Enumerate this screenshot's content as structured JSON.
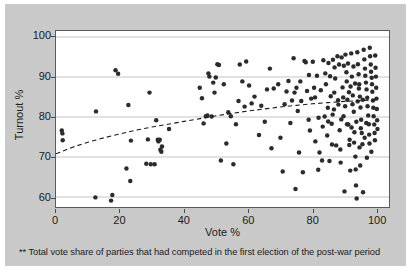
{
  "figure": {
    "footnote": "** Total vote share of parties that had competed in the first election of the post-war period",
    "background_color": "#c9c9c9",
    "plot_background_color": "#ffffff",
    "point_color": "#2b2b2b",
    "gridline_color": "#c4c4c4",
    "trendline_color": "#1b1b1b"
  },
  "chart_data": {
    "type": "scatter",
    "title": "",
    "subtitle": "",
    "xlabel": "Vote %",
    "ylabel": "Turnout %",
    "xlim": [
      0,
      104
    ],
    "ylim": [
      57.5,
      101.5
    ],
    "xticks": [
      0,
      20,
      40,
      60,
      80,
      100
    ],
    "xticklabels": [
      "0",
      "20",
      "40",
      "60",
      "80",
      "100"
    ],
    "yticks": [
      60,
      70,
      80,
      90,
      100
    ],
    "yticklabels": [
      "60",
      "70",
      "80",
      "90",
      "100"
    ],
    "grid": "horizontal",
    "legend": "none",
    "annotations": [
      "** Total vote share of parties that had competed in the first election of the post-war period"
    ],
    "series": [
      {
        "name": "Elections",
        "marker": "filled-circle",
        "points": [
          [
            1.8,
            76.6
          ],
          [
            2.0,
            75.9
          ],
          [
            2.1,
            74.2
          ],
          [
            12.3,
            59.9
          ],
          [
            12.5,
            81.4
          ],
          [
            17.2,
            59.1
          ],
          [
            17.6,
            60.5
          ],
          [
            18.6,
            91.7
          ],
          [
            19.4,
            90.8
          ],
          [
            22.0,
            67.1
          ],
          [
            22.6,
            83.0
          ],
          [
            23.2,
            64.0
          ],
          [
            23.4,
            74.1
          ],
          [
            28.2,
            68.3
          ],
          [
            28.7,
            74.4
          ],
          [
            29.2,
            86.1
          ],
          [
            29.6,
            68.2
          ],
          [
            30.8,
            68.2
          ],
          [
            31.3,
            79.2
          ],
          [
            31.8,
            74.3
          ],
          [
            32.0,
            73.9
          ],
          [
            32.4,
            74.3
          ],
          [
            32.6,
            71.8
          ],
          [
            32.9,
            71.3
          ],
          [
            33.1,
            72.6
          ],
          [
            35.3,
            77.0
          ],
          [
            44.9,
            87.3
          ],
          [
            45.6,
            84.7
          ],
          [
            46.1,
            78.4
          ],
          [
            46.8,
            80.2
          ],
          [
            47.3,
            80.4
          ],
          [
            47.6,
            90.9
          ],
          [
            47.9,
            90.1
          ],
          [
            48.6,
            80.1
          ],
          [
            49.1,
            88.6
          ],
          [
            49.5,
            86.1
          ],
          [
            49.9,
            89.9
          ],
          [
            50.4,
            93.2
          ],
          [
            50.9,
            93.0
          ],
          [
            51.5,
            69.1
          ],
          [
            52.4,
            88.2
          ],
          [
            53.2,
            73.4
          ],
          [
            53.8,
            81.2
          ],
          [
            54.6,
            80.2
          ],
          [
            55.4,
            68.2
          ],
          [
            56.2,
            78.2
          ],
          [
            57.0,
            84.0
          ],
          [
            57.4,
            93.1
          ],
          [
            58.2,
            88.9
          ],
          [
            58.9,
            82.6
          ],
          [
            59.4,
            93.9
          ],
          [
            60.3,
            87.9
          ],
          [
            61.1,
            83.4
          ],
          [
            62.0,
            85.1
          ],
          [
            63.4,
            75.5
          ],
          [
            64.1,
            82.8
          ],
          [
            65.2,
            78.8
          ],
          [
            65.9,
            86.9
          ],
          [
            66.8,
            92.1
          ],
          [
            67.3,
            72.2
          ],
          [
            68.0,
            87.1
          ],
          [
            69.4,
            88.2
          ],
          [
            70.1,
            74.8
          ],
          [
            70.8,
            66.4
          ],
          [
            71.4,
            83.2
          ],
          [
            72.0,
            86.4
          ],
          [
            72.6,
            89.0
          ],
          [
            73.2,
            78.5
          ],
          [
            73.7,
            84.1
          ],
          [
            74.2,
            94.7
          ],
          [
            74.5,
            86.1
          ],
          [
            74.8,
            62.0
          ],
          [
            75.1,
            87.3
          ],
          [
            75.5,
            81.5
          ],
          [
            75.9,
            71.1
          ],
          [
            76.3,
            88.9
          ],
          [
            76.6,
            84.0
          ],
          [
            77.1,
            66.2
          ],
          [
            77.6,
            94.0
          ],
          [
            78.0,
            93.7
          ],
          [
            78.4,
            86.5
          ],
          [
            78.9,
            79.3
          ],
          [
            79.3,
            76.6
          ],
          [
            79.7,
            84.6
          ],
          [
            80.2,
            93.8
          ],
          [
            80.6,
            87.3
          ],
          [
            81.0,
            73.9
          ],
          [
            81.5,
            90.3
          ],
          [
            81.9,
            66.8
          ],
          [
            82.3,
            71.1
          ],
          [
            82.7,
            86.7
          ],
          [
            83.1,
            69.1
          ],
          [
            83.5,
            94.2
          ],
          [
            83.9,
            80.1
          ],
          [
            84.3,
            88.2
          ],
          [
            84.7,
            75.4
          ],
          [
            85.1,
            93.5
          ],
          [
            85.4,
            69.0
          ],
          [
            85.8,
            85.2
          ],
          [
            86.1,
            78.3
          ],
          [
            86.5,
            94.3
          ],
          [
            86.8,
            81.9
          ],
          [
            87.2,
            89.6
          ],
          [
            87.5,
            72.9
          ],
          [
            87.9,
            95.2
          ],
          [
            88.2,
            83.1
          ],
          [
            88.6,
            76.7
          ],
          [
            88.9,
            68.6
          ],
          [
            89.2,
            94.9
          ],
          [
            89.5,
            87.4
          ],
          [
            89.8,
            80.2
          ],
          [
            90.1,
            61.4
          ],
          [
            90.4,
            95.6
          ],
          [
            90.7,
            91.2
          ],
          [
            91.0,
            84.3
          ],
          [
            91.3,
            78.1
          ],
          [
            91.6,
            73.0
          ],
          [
            91.9,
            66.6
          ],
          [
            92.2,
            95.9
          ],
          [
            92.4,
            90.1
          ],
          [
            92.7,
            85.4
          ],
          [
            93.0,
            81.3
          ],
          [
            93.2,
            76.2
          ],
          [
            93.5,
            70.1
          ],
          [
            93.7,
            62.9
          ],
          [
            93.9,
            59.6
          ],
          [
            94.1,
            96.2
          ],
          [
            94.3,
            93.2
          ],
          [
            94.5,
            90.7
          ],
          [
            94.7,
            88.2
          ],
          [
            94.9,
            85.1
          ],
          [
            95.1,
            82.4
          ],
          [
            95.3,
            79.3
          ],
          [
            95.5,
            76.0
          ],
          [
            95.7,
            73.2
          ],
          [
            95.9,
            61.2
          ],
          [
            96.1,
            96.8
          ],
          [
            96.3,
            94.4
          ],
          [
            96.5,
            92.1
          ],
          [
            96.6,
            90.3
          ],
          [
            96.8,
            88.6
          ],
          [
            97.0,
            86.9
          ],
          [
            97.2,
            84.8
          ],
          [
            97.3,
            82.7
          ],
          [
            97.5,
            80.4
          ],
          [
            97.7,
            78.2
          ],
          [
            97.8,
            75.6
          ],
          [
            98.0,
            97.3
          ],
          [
            98.1,
            95.2
          ],
          [
            98.3,
            93.1
          ],
          [
            98.4,
            91.3
          ],
          [
            98.6,
            89.8
          ],
          [
            98.7,
            88.2
          ],
          [
            98.8,
            86.3
          ],
          [
            99.0,
            84.1
          ],
          [
            99.1,
            82.3
          ],
          [
            99.2,
            80.2
          ],
          [
            99.4,
            78.1
          ],
          [
            99.5,
            76.0
          ],
          [
            99.6,
            74.2
          ],
          [
            99.7,
            95.4
          ],
          [
            99.8,
            92.3
          ],
          [
            99.9,
            90.1
          ],
          [
            100.0,
            87.3
          ],
          [
            100.1,
            84.6
          ],
          [
            100.2,
            82.0
          ],
          [
            100.3,
            79.2
          ],
          [
            100.4,
            77.0
          ],
          [
            87.0,
            92.4
          ],
          [
            88.4,
            93.1
          ],
          [
            89.9,
            92.8
          ],
          [
            91.2,
            93.4
          ],
          [
            92.9,
            92.6
          ],
          [
            90.8,
            88.9
          ],
          [
            92.0,
            87.6
          ],
          [
            93.4,
            88.4
          ],
          [
            94.6,
            87.1
          ],
          [
            91.5,
            86.2
          ],
          [
            89.7,
            84.9
          ],
          [
            88.1,
            84.2
          ],
          [
            90.3,
            82.7
          ],
          [
            92.6,
            83.2
          ],
          [
            94.2,
            83.9
          ],
          [
            95.8,
            84.3
          ],
          [
            89.1,
            79.4
          ],
          [
            90.9,
            78.2
          ],
          [
            92.3,
            77.4
          ],
          [
            93.8,
            78.8
          ],
          [
            95.2,
            77.2
          ],
          [
            96.9,
            78.5
          ],
          [
            91.7,
            74.3
          ],
          [
            93.1,
            73.6
          ],
          [
            94.8,
            72.4
          ],
          [
            96.4,
            74.8
          ],
          [
            97.9,
            73.4
          ],
          [
            85.6,
            90.2
          ],
          [
            86.9,
            86.1
          ],
          [
            84.9,
            82.3
          ],
          [
            83.3,
            77.6
          ],
          [
            86.2,
            73.1
          ],
          [
            88.8,
            71.9
          ],
          [
            98.5,
            71.3
          ],
          [
            97.1,
            69.8
          ],
          [
            95.0,
            67.9
          ],
          [
            93.6,
            66.9
          ],
          [
            79.0,
            90.5
          ],
          [
            80.9,
            84.9
          ],
          [
            82.0,
            79.8
          ],
          [
            84.1,
            90.9
          ],
          [
            85.0,
            78.9
          ],
          [
            86.4,
            80.6
          ]
        ]
      }
    ],
    "trendline": {
      "style": "dashed",
      "description": "fitted logarithmic trend rising from ~70.8% turnout at 0% vote to ~84.3% at 100% vote",
      "points": [
        [
          0,
          70.8
        ],
        [
          5,
          72.4
        ],
        [
          10,
          73.7
        ],
        [
          15,
          74.8
        ],
        [
          20,
          75.8
        ],
        [
          25,
          76.7
        ],
        [
          30,
          77.5
        ],
        [
          35,
          78.2
        ],
        [
          40,
          78.9
        ],
        [
          45,
          79.6
        ],
        [
          50,
          80.3
        ],
        [
          55,
          80.9
        ],
        [
          60,
          81.5
        ],
        [
          65,
          82.0
        ],
        [
          70,
          82.5
        ],
        [
          75,
          82.9
        ],
        [
          80,
          83.3
        ],
        [
          85,
          83.6
        ],
        [
          90,
          83.9
        ],
        [
          95,
          84.1
        ],
        [
          100,
          84.3
        ]
      ]
    }
  }
}
